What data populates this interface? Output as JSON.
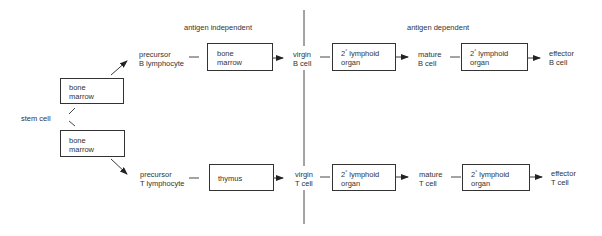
{
  "sections": {
    "left_header": "antigen   independent",
    "right_header": "antigen  dependent"
  },
  "stem_cell": "stem cell",
  "left_boxes": [
    {
      "line1": "bone",
      "line2": "marrow"
    },
    {
      "line1": "bone",
      "line2": "marrow"
    }
  ],
  "rows": [
    {
      "precursor": {
        "line1": "precursor",
        "line2": "B lymphocyte"
      },
      "primary_organ": {
        "line1": "bone",
        "line2": "marrow"
      },
      "virgin": {
        "line1": "virgin",
        "line2": "B cell"
      },
      "secondary_organ_1": {
        "prefix": "2",
        "degree": "°",
        "line1": " lymphoid",
        "line2": "organ"
      },
      "mature": {
        "line1": "mature",
        "line2": "B cell"
      },
      "secondary_organ_2": {
        "prefix": "2",
        "degree": "°",
        "line1": " lymphoid",
        "line2": "organ"
      },
      "effector": {
        "line1": "effector",
        "line2": "B cell"
      }
    },
    {
      "precursor": {
        "line1": "precursor",
        "line2": "T lymphocyte"
      },
      "primary_organ": {
        "line1": "thymus",
        "line2": ""
      },
      "virgin": {
        "line1": "virgin",
        "line2": "T cell"
      },
      "secondary_organ_1": {
        "prefix": "2",
        "degree": "°",
        "line1": " lymphoid",
        "line2": "organ"
      },
      "mature": {
        "line1": "mature",
        "line2": "T cell"
      },
      "secondary_organ_2": {
        "prefix": "2",
        "degree": "°",
        "line1": " lymphoid",
        "line2": "organ"
      },
      "effector": {
        "line1": "effector",
        "line2": "T cell"
      }
    }
  ]
}
